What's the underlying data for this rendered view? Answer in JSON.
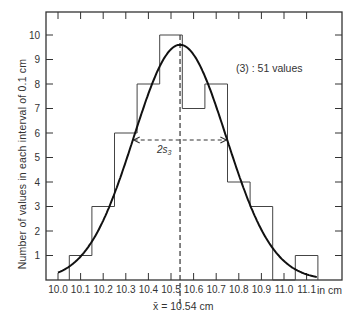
{
  "chart_data": {
    "type": "bar",
    "subtype": "histogram_with_normal_curve",
    "title": "",
    "xlabel": "in cm",
    "ylabel": "Number of values in each interval of 0.1 cm",
    "x_tick_labels": [
      "10.0",
      "10.1",
      "10.2",
      "10.3",
      "10.4",
      "10.5",
      "10.6",
      "10.7",
      "10.8",
      "10.9",
      "11.0",
      "11.1"
    ],
    "y_tick_labels": [
      "1",
      "2",
      "3",
      "4",
      "5",
      "6",
      "7",
      "8",
      "9",
      "10"
    ],
    "xlim": [
      9.95,
      11.2
    ],
    "ylim": [
      0,
      11
    ],
    "bin_width": 0.1,
    "categories": [
      "10.1",
      "10.2",
      "10.3",
      "10.4",
      "10.5",
      "10.6",
      "10.7",
      "10.8",
      "10.9",
      "11.0",
      "11.1"
    ],
    "values": [
      1,
      3,
      6,
      8,
      10,
      7,
      8,
      4,
      3,
      0,
      1
    ],
    "total_count": 51,
    "normal_curve": {
      "mean": 10.54,
      "sd": 0.205,
      "peak": 9.6
    },
    "annotations": {
      "series_label": "(3) : 51 values",
      "spread_label": "2s",
      "spread_subscript": "3",
      "mean_label": "x̄ = 10.54 cm",
      "mean_value": 10.54
    },
    "grid": false,
    "legend": null
  },
  "labels": {
    "ylabel": "Number of values in each interval of 0.1 cm",
    "xunit": "in cm",
    "series_label": "(3) : 51 values",
    "mean_label": "x̄ = 10.54 cm"
  }
}
